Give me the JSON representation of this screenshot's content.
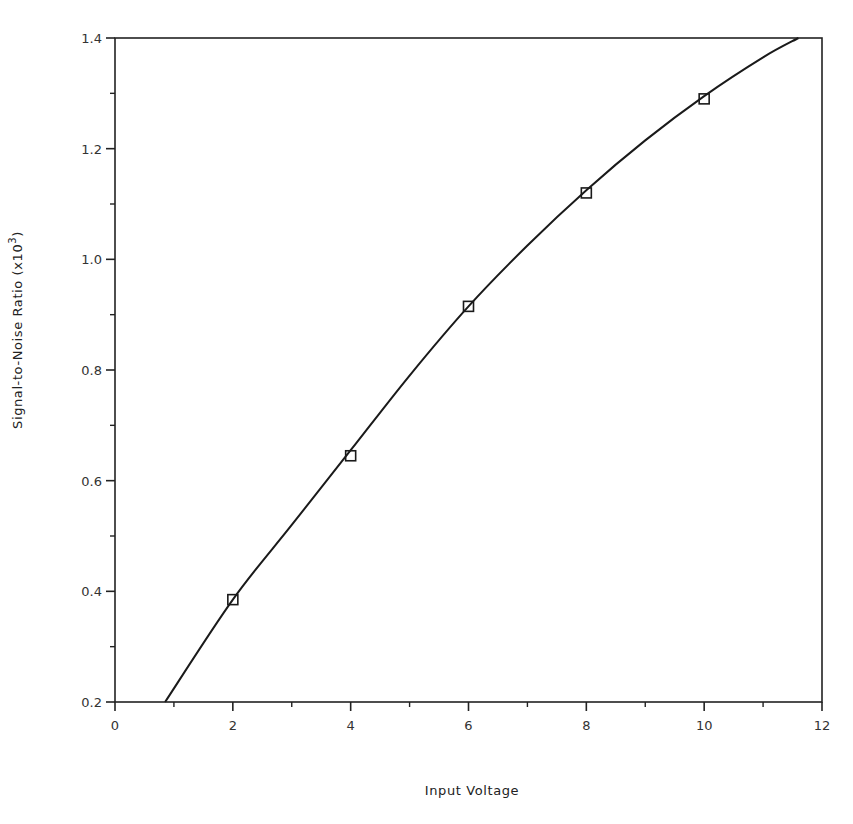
{
  "chart_data": {
    "type": "line",
    "title": "",
    "xlabel": "Input Voltage",
    "ylabel": "Signal-to-Noise Ratio (x10^3)",
    "ylabel_parts": {
      "main": "Signal-to-Noise Ratio (x10",
      "sup": "3",
      "close": ")"
    },
    "xlim": [
      0,
      12
    ],
    "ylim": [
      0.2,
      1.4
    ],
    "x_ticks": [
      0,
      2,
      4,
      6,
      8,
      10,
      12
    ],
    "x_tick_labels": [
      "0",
      "2",
      "4",
      "6",
      "8",
      "10",
      "12"
    ],
    "x_minor_ticks": [
      1,
      3,
      5,
      7,
      9,
      11
    ],
    "y_ticks": [
      0.2,
      0.4,
      0.6,
      0.8,
      1.0,
      1.2,
      1.4
    ],
    "y_tick_labels": [
      "0.2",
      "0.4",
      "0.6",
      "0.8",
      "1.0",
      "1.2",
      "1.4"
    ],
    "y_minor_ticks": [
      0.3,
      0.5,
      0.7,
      0.9,
      1.1,
      1.3
    ],
    "grid": false,
    "legend": null,
    "series": [
      {
        "name": "Measured",
        "style": "markers",
        "marker": "open-square",
        "x": [
          2,
          4,
          6,
          8,
          10
        ],
        "y": [
          0.385,
          0.645,
          0.915,
          1.12,
          1.29
        ]
      },
      {
        "name": "Fit",
        "style": "line",
        "x": [
          0.85,
          2,
          3,
          4,
          5,
          6,
          7,
          8,
          9,
          10,
          11,
          11.6
        ],
        "y": [
          0.2,
          0.385,
          0.52,
          0.655,
          0.79,
          0.915,
          1.025,
          1.125,
          1.215,
          1.295,
          1.365,
          1.4
        ]
      }
    ]
  }
}
